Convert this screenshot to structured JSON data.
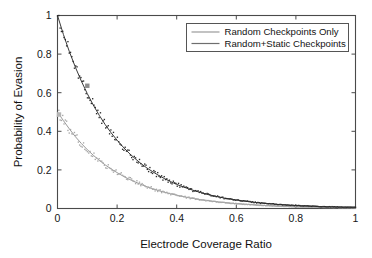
{
  "chart_data": {
    "type": "scatter",
    "title": "",
    "subtitle": "",
    "xlabel": "Electrode Coverage Ratio",
    "ylabel": "Probability of Evasion",
    "xlim": [
      0,
      1
    ],
    "ylim": [
      0,
      1
    ],
    "xticks": [
      0,
      0.2,
      0.4,
      0.6,
      0.8,
      1
    ],
    "xtick_labels": [
      "0",
      "0.2",
      "0.4",
      "0.6",
      "0.8",
      "1"
    ],
    "yticks": [
      0,
      0.2,
      0.4,
      0.6,
      0.8,
      1
    ],
    "ytick_labels": [
      "0",
      "0.2",
      "0.4",
      "0.6",
      "0.8",
      "1"
    ],
    "grid": false,
    "legend_position": "top-right",
    "annotations": [],
    "series": [
      {
        "name": "Random Checkpoints Only",
        "color": "#9a9a9a",
        "style": "line+scatter",
        "marker": "dot",
        "fit": "exponential",
        "y0": 0.5,
        "decay_rate": 6.0,
        "x": [
          0.0,
          0.02,
          0.04,
          0.06,
          0.08,
          0.1,
          0.12,
          0.14,
          0.16,
          0.18,
          0.2,
          0.22,
          0.24,
          0.26,
          0.28,
          0.3,
          0.32,
          0.34,
          0.36,
          0.38,
          0.4,
          0.42,
          0.44,
          0.46,
          0.48,
          0.5,
          0.52,
          0.54,
          0.56,
          0.58,
          0.6,
          0.62,
          0.64,
          0.66,
          0.68,
          0.7,
          0.72,
          0.74,
          0.76,
          0.78,
          0.8,
          0.82,
          0.84,
          0.86,
          0.88,
          0.9,
          0.92,
          0.94,
          0.96,
          0.98,
          1.0
        ],
        "values": [
          0.5,
          0.455,
          0.412,
          0.372,
          0.337,
          0.305,
          0.276,
          0.25,
          0.226,
          0.205,
          0.186,
          0.168,
          0.152,
          0.138,
          0.125,
          0.113,
          0.102,
          0.092,
          0.084,
          0.076,
          0.069,
          0.062,
          0.056,
          0.051,
          0.046,
          0.042,
          0.038,
          0.034,
          0.031,
          0.028,
          0.025,
          0.023,
          0.021,
          0.019,
          0.017,
          0.015,
          0.014,
          0.012,
          0.011,
          0.01,
          0.009,
          0.008,
          0.008,
          0.007,
          0.006,
          0.006,
          0.005,
          0.005,
          0.004,
          0.004,
          0.004
        ]
      },
      {
        "name": "Random+Static Checkpoints",
        "color": "#3a3a3a",
        "style": "line+scatter",
        "marker": "dot",
        "fit": "exponential",
        "y0": 1.0,
        "decay_rate": 5.2,
        "x": [
          0.0,
          0.02,
          0.04,
          0.06,
          0.08,
          0.1,
          0.12,
          0.14,
          0.16,
          0.18,
          0.2,
          0.22,
          0.24,
          0.26,
          0.28,
          0.3,
          0.32,
          0.34,
          0.36,
          0.38,
          0.4,
          0.42,
          0.44,
          0.46,
          0.48,
          0.5,
          0.52,
          0.54,
          0.56,
          0.58,
          0.6,
          0.62,
          0.64,
          0.66,
          0.68,
          0.7,
          0.72,
          0.74,
          0.76,
          0.78,
          0.8,
          0.82,
          0.84,
          0.86,
          0.88,
          0.9,
          0.92,
          0.94,
          0.96,
          0.98,
          1.0
        ],
        "values": [
          1.0,
          0.901,
          0.812,
          0.732,
          0.66,
          0.595,
          0.536,
          0.483,
          0.435,
          0.392,
          0.354,
          0.319,
          0.287,
          0.259,
          0.233,
          0.21,
          0.19,
          0.171,
          0.154,
          0.139,
          0.125,
          0.113,
          0.102,
          0.092,
          0.083,
          0.074,
          0.067,
          0.06,
          0.054,
          0.049,
          0.044,
          0.04,
          0.036,
          0.032,
          0.029,
          0.026,
          0.024,
          0.021,
          0.019,
          0.017,
          0.016,
          0.014,
          0.013,
          0.012,
          0.01,
          0.009,
          0.009,
          0.008,
          0.007,
          0.007,
          0.006
        ]
      }
    ]
  },
  "axes": {
    "xlabel": "Electrode Coverage Ratio",
    "ylabel": "Probability of Evasion",
    "xtick_labels": [
      "0",
      "0.2",
      "0.4",
      "0.6",
      "0.8",
      "1"
    ],
    "ytick_labels": [
      "0",
      "0.2",
      "0.4",
      "0.6",
      "0.8",
      "1"
    ],
    "frame_color": "#4a4a4a"
  },
  "legend": {
    "entries": [
      {
        "label": "Random Checkpoints Only",
        "color": "#9a9a9a"
      },
      {
        "label": "Random+Static Checkpoints",
        "color": "#6e6e6e"
      }
    ],
    "border_color": "#555555",
    "background": "#ffffff"
  }
}
